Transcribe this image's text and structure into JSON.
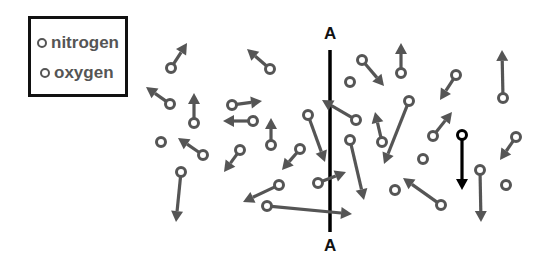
{
  "legend": {
    "items": [
      {
        "label": "nitrogen",
        "color": "#555555"
      },
      {
        "label": "oxygen",
        "color": "#555555"
      }
    ]
  },
  "boundary": {
    "top_label": "A",
    "bottom_label": "A",
    "x": 330,
    "y1": 50,
    "y2": 232,
    "color": "#000000"
  },
  "colors": {
    "molecule": "#555555",
    "highlight": "#000000"
  },
  "molecules": [
    {
      "cx": 171,
      "cy": 68,
      "tx": 187,
      "ty": 43
    },
    {
      "cx": 170,
      "cy": 104,
      "tx": 146,
      "ty": 87
    },
    {
      "cx": 194,
      "cy": 123,
      "tx": 194,
      "ty": 93
    },
    {
      "cx": 232,
      "cy": 105,
      "tx": 262,
      "ty": 101
    },
    {
      "cx": 253,
      "cy": 121,
      "tx": 223,
      "ty": 121
    },
    {
      "cx": 271,
      "cy": 145,
      "tx": 271,
      "ty": 118
    },
    {
      "cx": 270,
      "cy": 69,
      "tx": 247,
      "ty": 49
    },
    {
      "cx": 161,
      "cy": 142
    },
    {
      "cx": 203,
      "cy": 155,
      "tx": 178,
      "ty": 138
    },
    {
      "cx": 240,
      "cy": 150,
      "tx": 224,
      "ty": 172
    },
    {
      "cx": 181,
      "cy": 172,
      "tx": 176,
      "ty": 222
    },
    {
      "cx": 300,
      "cy": 149,
      "tx": 282,
      "ty": 170
    },
    {
      "cx": 308,
      "cy": 115,
      "tx": 325,
      "ty": 162
    },
    {
      "cx": 356,
      "cy": 120,
      "tx": 322,
      "ty": 100
    },
    {
      "cx": 279,
      "cy": 185,
      "tx": 243,
      "ty": 202
    },
    {
      "cx": 267,
      "cy": 206,
      "tx": 352,
      "ty": 214
    },
    {
      "cx": 318,
      "cy": 183,
      "tx": 346,
      "ty": 172
    },
    {
      "cx": 350,
      "cy": 140,
      "tx": 364,
      "ty": 200
    },
    {
      "cx": 350,
      "cy": 82
    },
    {
      "cx": 362,
      "cy": 60,
      "tx": 384,
      "ty": 86
    },
    {
      "cx": 401,
      "cy": 73,
      "tx": 401,
      "ty": 43
    },
    {
      "cx": 382,
      "cy": 142,
      "tx": 375,
      "ty": 112
    },
    {
      "cx": 409,
      "cy": 101,
      "tx": 384,
      "ty": 164
    },
    {
      "cx": 456,
      "cy": 75,
      "tx": 440,
      "ty": 100
    },
    {
      "cx": 433,
      "cy": 136,
      "tx": 452,
      "ty": 112
    },
    {
      "cx": 503,
      "cy": 98,
      "tx": 502,
      "ty": 50
    },
    {
      "cx": 423,
      "cy": 159
    },
    {
      "cx": 441,
      "cy": 205,
      "tx": 403,
      "ty": 178
    },
    {
      "cx": 395,
      "cy": 190
    },
    {
      "cx": 516,
      "cy": 137,
      "tx": 500,
      "ty": 160
    },
    {
      "cx": 480,
      "cy": 170,
      "tx": 481,
      "ty": 222
    },
    {
      "cx": 506,
      "cy": 185
    },
    {
      "cx": 462,
      "cy": 135,
      "tx": 462,
      "ty": 190,
      "highlight": true
    }
  ]
}
